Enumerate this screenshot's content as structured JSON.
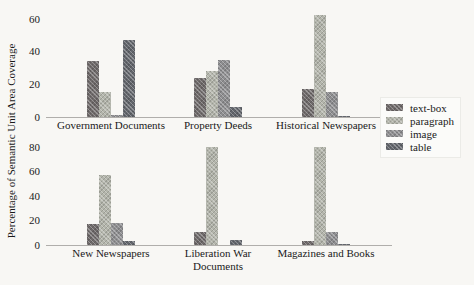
{
  "figure": {
    "ylabel": "Percentage of Semantic Unit Area Coverage"
  },
  "colors": {
    "text-box": "#6f6a6a",
    "paragraph": "#b3b5ab",
    "image": "#8e8e90",
    "table": "#63666c"
  },
  "legend": {
    "entries": [
      "text-box",
      "paragraph",
      "image",
      "table"
    ]
  },
  "chart_data": [
    {
      "type": "bar",
      "position": "top-row",
      "categories": [
        "Government Documents",
        "Property Deeds",
        "Historical Newspapers"
      ],
      "series": [
        {
          "name": "text-box",
          "values": [
            34,
            24,
            17
          ]
        },
        {
          "name": "paragraph",
          "values": [
            15,
            28,
            62
          ]
        },
        {
          "name": "image",
          "values": [
            1,
            35,
            15
          ]
        },
        {
          "name": "table",
          "values": [
            47,
            6,
            0.5
          ]
        }
      ],
      "yticks": [
        0,
        20,
        40,
        60
      ],
      "ylim": [
        0,
        64
      ],
      "grid": false,
      "legend_position": "right-outside"
    },
    {
      "type": "bar",
      "position": "bottom-row",
      "categories": [
        "New Newspapers",
        "Liberation War Documents",
        "Magazines and Books"
      ],
      "series": [
        {
          "name": "text-box",
          "values": [
            17,
            11,
            3
          ]
        },
        {
          "name": "paragraph",
          "values": [
            57,
            80,
            80
          ]
        },
        {
          "name": "image",
          "values": [
            18,
            0,
            11
          ]
        },
        {
          "name": "table",
          "values": [
            3,
            4,
            0.5
          ]
        }
      ],
      "yticks": [
        0,
        20,
        40,
        60,
        80
      ],
      "ylim": [
        0,
        84
      ],
      "grid": false
    }
  ]
}
